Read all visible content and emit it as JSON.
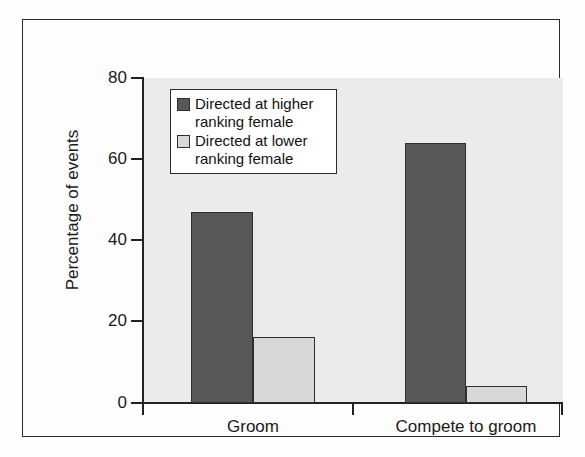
{
  "chart_data": {
    "type": "bar",
    "title": "",
    "xlabel": "",
    "ylabel": "Percentage of events",
    "categories": [
      "Groom",
      "Compete to groom"
    ],
    "series": [
      {
        "name": "Directed at higher ranking female",
        "name_line1": "Directed at higher",
        "name_line2": "ranking female",
        "color": "#585858",
        "values": [
          47,
          64
        ]
      },
      {
        "name": "Directed at lower ranking female",
        "name_line1": "Directed at lower",
        "name_line2": "ranking female",
        "color": "#d8d8d8",
        "values": [
          16.3,
          4.3
        ]
      }
    ],
    "ylim": [
      0,
      80
    ],
    "yticks": [
      0,
      20,
      40,
      60,
      80
    ],
    "ytick_labels": [
      "0",
      "20",
      "40",
      "60",
      "80"
    ],
    "grid": false,
    "legend_position": "upper-left-inside",
    "plot_background": "#ebebeb",
    "figure_background": "#fdfdfd",
    "axis_color": "#222222"
  },
  "axis": {
    "y_title": "Percentage of events",
    "tick_0": "0",
    "tick_20": "20",
    "tick_40": "40",
    "tick_60": "60",
    "tick_80": "80"
  },
  "categories": {
    "cat_0": "Groom",
    "cat_1": "Compete to groom"
  },
  "legend": {
    "entry_0_line1": "Directed at higher",
    "entry_0_line2": "ranking female",
    "entry_1_line1": "Directed at lower",
    "entry_1_line2": "ranking female"
  }
}
